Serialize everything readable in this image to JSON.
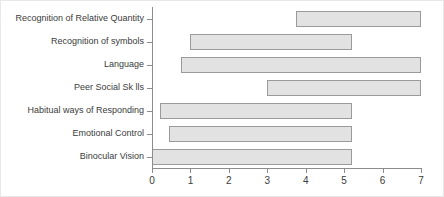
{
  "chart_data": {
    "type": "bar",
    "orientation": "horizontal",
    "subtype": "range-bar",
    "title": "",
    "xlabel": "",
    "ylabel": "",
    "xlim": [
      0,
      7
    ],
    "ylim": [
      0,
      7
    ],
    "grid": false,
    "legend": null,
    "xticks": [
      "0",
      "1",
      "2",
      "3",
      "4",
      "5",
      "6",
      "7"
    ],
    "xtick_values": [
      0,
      1,
      2,
      3,
      4,
      5,
      6,
      7
    ],
    "categories": [
      "Recognition of Relative Quantity",
      "Recognition of symbols",
      "Language",
      "Peer Social Sk lls",
      "Habitual ways of Responding",
      "Emotional Control",
      "Binocular Vision"
    ],
    "bar_fill_color": "#e2e2e2",
    "bar_edge_color": "#9a9a9a",
    "axis_color": "#8c8c8c",
    "text_color": "#3b3b3b",
    "background_color": "#ffffff",
    "bars": [
      {
        "category": "Recognition of Relative Quantity",
        "start": 3.75,
        "end": 7.0,
        "length": 3.25
      },
      {
        "category": "Recognition of symbols",
        "start": 1.0,
        "end": 5.2,
        "length": 4.2
      },
      {
        "category": "Language",
        "start": 0.75,
        "end": 7.0,
        "length": 6.25
      },
      {
        "category": "Peer Social Sk lls",
        "start": 3.0,
        "end": 7.0,
        "length": 4.0
      },
      {
        "category": "Habitual ways of Responding",
        "start": 0.2,
        "end": 5.2,
        "length": 5.0
      },
      {
        "category": "Emotional Control",
        "start": 0.45,
        "end": 5.2,
        "length": 4.75
      },
      {
        "category": "Binocular Vision",
        "start": 0.0,
        "end": 5.2,
        "length": 5.2
      }
    ]
  }
}
